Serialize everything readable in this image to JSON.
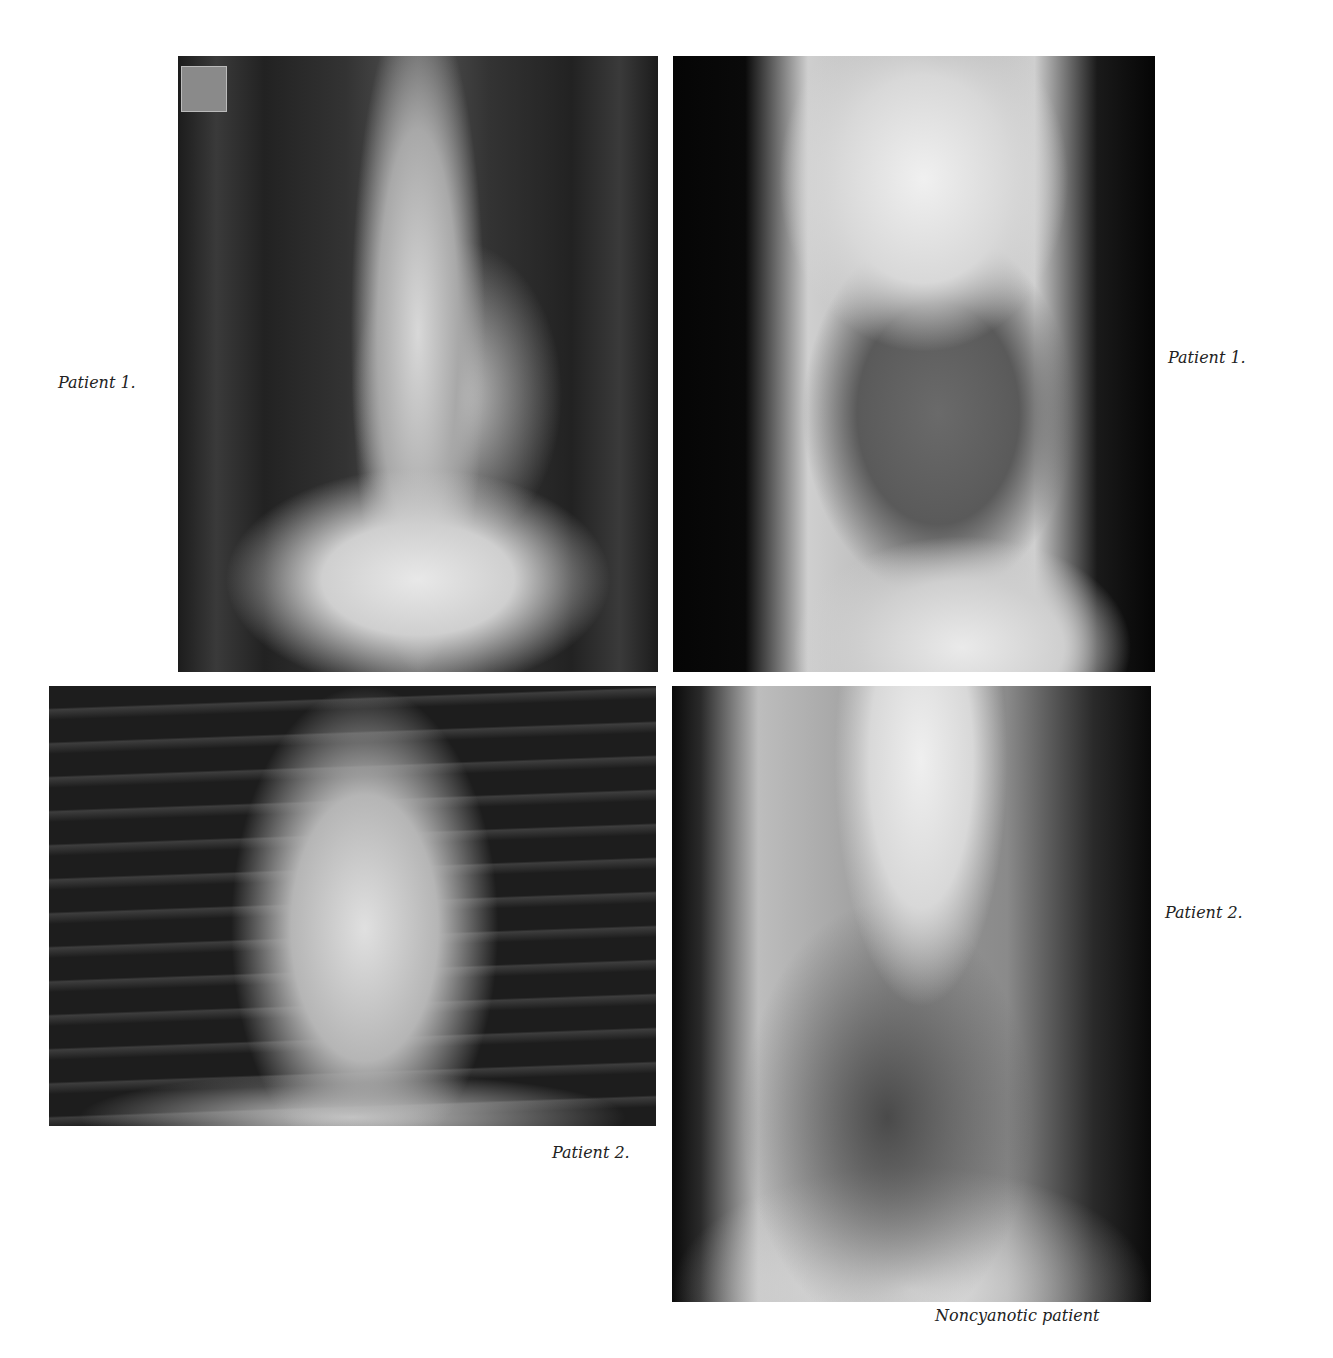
{
  "figure": {
    "panels": [
      {
        "id": "pa1",
        "view": "frontal chest radiograph",
        "caption": "Patient 1."
      },
      {
        "id": "lat1",
        "view": "lateral chest radiograph",
        "caption": "Patient 1."
      },
      {
        "id": "pa2",
        "view": "frontal chest radiograph",
        "caption": "Patient 2."
      },
      {
        "id": "lat2",
        "view": "lateral chest radiograph",
        "caption": "Patient 2."
      }
    ],
    "footer_caption": "Noncyanotic patient"
  }
}
